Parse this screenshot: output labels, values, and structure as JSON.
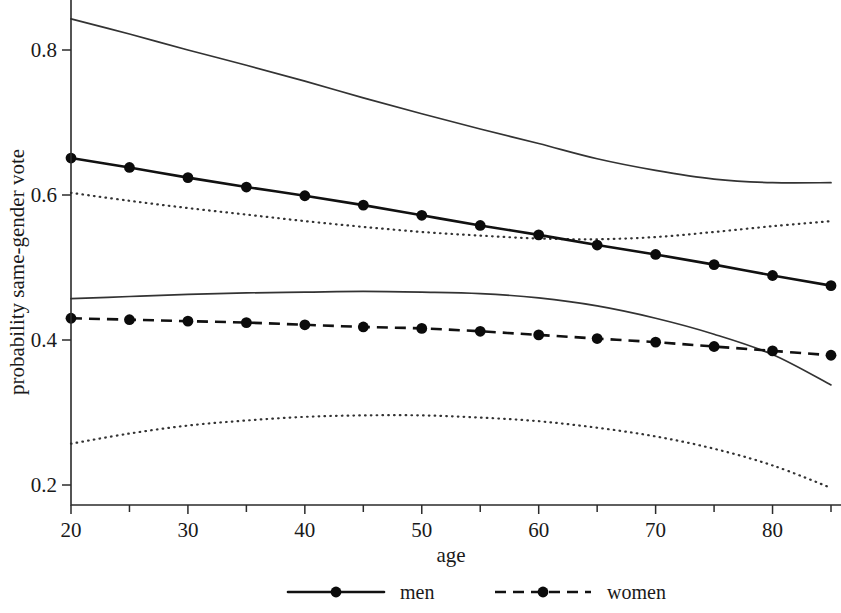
{
  "chart_data": {
    "type": "line",
    "title": "",
    "subtitle": "",
    "xlabel": "age",
    "ylabel": "probability same-gender vote",
    "xlim": [
      18,
      87
    ],
    "ylim": [
      0.18,
      0.845
    ],
    "grid": false,
    "legend_position": "bottom-center",
    "x_ticks": [
      20,
      30,
      40,
      50,
      60,
      70,
      80
    ],
    "x_minor_ticks": [
      25,
      35,
      45,
      55,
      65,
      75,
      85
    ],
    "y_ticks": [
      0.2,
      0.4,
      0.6,
      0.8
    ],
    "x_tick_labels": [
      "20",
      "30",
      "40",
      "50",
      "60",
      "70",
      "80"
    ],
    "y_tick_labels": [
      "0.2",
      "0.4",
      "0.6",
      "0.8"
    ],
    "marker_x": [
      20,
      25,
      30,
      35,
      40,
      45,
      50,
      55,
      60,
      65,
      70,
      75,
      80,
      85
    ],
    "series": [
      {
        "name": "men",
        "style": "solid",
        "marker": "filled-circle",
        "color": "#111111",
        "x": [
          20,
          25,
          30,
          35,
          40,
          45,
          50,
          55,
          60,
          65,
          70,
          75,
          80,
          85
        ],
        "values": [
          0.651,
          0.638,
          0.624,
          0.611,
          0.599,
          0.586,
          0.572,
          0.558,
          0.545,
          0.531,
          0.518,
          0.504,
          0.489,
          0.475
        ]
      },
      {
        "name": "women",
        "style": "dashed",
        "marker": "filled-circle",
        "color": "#111111",
        "x": [
          20,
          25,
          30,
          35,
          40,
          45,
          50,
          55,
          60,
          65,
          70,
          75,
          80,
          85
        ],
        "values": [
          0.43,
          0.428,
          0.426,
          0.424,
          0.421,
          0.418,
          0.416,
          0.412,
          0.407,
          0.402,
          0.397,
          0.391,
          0.385,
          0.379
        ]
      }
    ],
    "confidence_bands": [
      {
        "name": "men-upper-ci",
        "style": "solid",
        "for_series": "men",
        "bound": "upper",
        "x": [
          20,
          25,
          30,
          35,
          40,
          45,
          50,
          55,
          60,
          65,
          70,
          75,
          80,
          85
        ],
        "values": [
          0.843,
          0.822,
          0.8,
          0.779,
          0.757,
          0.734,
          0.712,
          0.691,
          0.671,
          0.65,
          0.634,
          0.622,
          0.617,
          0.617
        ]
      },
      {
        "name": "men-lower-ci",
        "style": "solid",
        "for_series": "men",
        "bound": "lower",
        "x": [
          20,
          25,
          30,
          35,
          40,
          45,
          50,
          55,
          60,
          65,
          70,
          75,
          80,
          85
        ],
        "values": [
          0.457,
          0.46,
          0.463,
          0.465,
          0.466,
          0.467,
          0.466,
          0.464,
          0.458,
          0.447,
          0.43,
          0.408,
          0.38,
          0.338
        ]
      },
      {
        "name": "women-upper-ci",
        "style": "dotted",
        "for_series": "women",
        "bound": "upper",
        "x": [
          20,
          25,
          30,
          35,
          40,
          45,
          50,
          55,
          60,
          65,
          70,
          75,
          80,
          85
        ],
        "values": [
          0.603,
          0.592,
          0.582,
          0.573,
          0.564,
          0.556,
          0.549,
          0.544,
          0.54,
          0.539,
          0.542,
          0.549,
          0.557,
          0.564
        ]
      },
      {
        "name": "women-lower-ci",
        "style": "dotted",
        "for_series": "women",
        "bound": "lower",
        "x": [
          20,
          25,
          30,
          35,
          40,
          45,
          50,
          55,
          60,
          65,
          70,
          75,
          80,
          85
        ],
        "values": [
          0.257,
          0.271,
          0.282,
          0.289,
          0.294,
          0.296,
          0.296,
          0.293,
          0.288,
          0.279,
          0.267,
          0.25,
          0.227,
          0.196
        ]
      }
    ],
    "legend": [
      {
        "label": "men",
        "style": "solid",
        "marker": "filled-circle"
      },
      {
        "label": "women",
        "style": "dashed",
        "marker": "filled-circle"
      }
    ],
    "colors": {
      "axis": "#2b2b2b",
      "series": "#111111",
      "ci": "#333333",
      "background": "#ffffff"
    }
  }
}
